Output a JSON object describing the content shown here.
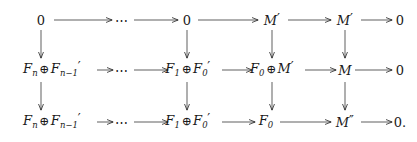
{
  "figure": {
    "kind": "commutative-diagram",
    "ink_color": "#1a1a1a",
    "background_color": "#ffffff"
  },
  "rows": [
    {
      "id": "row-top",
      "y": 20,
      "nodes": [
        {
          "id": "r1c1",
          "x": 41,
          "kind": "zero",
          "base": "0",
          "sub": "",
          "primes": 0,
          "trailing": ""
        },
        {
          "id": "r1c2",
          "x": 123,
          "kind": "ellipsis",
          "base": "⋯",
          "sub": "",
          "primes": 0,
          "trailing": ""
        },
        {
          "id": "r1c3",
          "x": 187,
          "kind": "zero",
          "base": "0",
          "sub": "",
          "primes": 0,
          "trailing": ""
        },
        {
          "id": "r1c4",
          "x": 272,
          "kind": "module",
          "base": "M",
          "sub": "",
          "primes": 1,
          "trailing": ""
        },
        {
          "id": "r1c5",
          "x": 345,
          "kind": "module",
          "base": "M",
          "sub": "",
          "primes": 1,
          "trailing": ""
        },
        {
          "id": "r1c6",
          "x": 400,
          "kind": "zero",
          "base": "0",
          "sub": "",
          "primes": 0,
          "trailing": ""
        }
      ]
    },
    {
      "id": "row-middle",
      "y": 70,
      "nodes": [
        {
          "id": "r2c1",
          "x": 52,
          "kind": "sum",
          "left_base": "F",
          "left_sub": "n",
          "left_primes": 0,
          "op": "⊕",
          "right_base": "F",
          "right_sub": "n−1",
          "right_primes": 1,
          "trailing": ""
        },
        {
          "id": "r2c2",
          "x": 123,
          "kind": "ellipsis",
          "base": "⋯",
          "sub": "",
          "primes": 0,
          "trailing": ""
        },
        {
          "id": "r2c3",
          "x": 188,
          "kind": "sum",
          "left_base": "F",
          "left_sub": "1",
          "left_primes": 0,
          "op": "⊕",
          "right_base": "F",
          "right_sub": "0",
          "right_primes": 1,
          "trailing": ""
        },
        {
          "id": "r2c4",
          "x": 272,
          "kind": "sum",
          "left_base": "F",
          "left_sub": "0",
          "left_primes": 0,
          "op": "⊕",
          "right_base": "M",
          "right_sub": "",
          "right_primes": 1,
          "trailing": ""
        },
        {
          "id": "r2c5",
          "x": 345,
          "kind": "module",
          "base": "M",
          "sub": "",
          "primes": 0,
          "trailing": ""
        },
        {
          "id": "r2c6",
          "x": 400,
          "kind": "zero",
          "base": "0",
          "sub": "",
          "primes": 0,
          "trailing": ""
        }
      ]
    },
    {
      "id": "row-bottom",
      "y": 122,
      "nodes": [
        {
          "id": "r3c1",
          "x": 52,
          "kind": "sum",
          "left_base": "F",
          "left_sub": "n",
          "left_primes": 0,
          "op": "⊕",
          "right_base": "F",
          "right_sub": "n−1",
          "right_primes": 1,
          "trailing": ""
        },
        {
          "id": "r3c2",
          "x": 123,
          "kind": "ellipsis",
          "base": "⋯",
          "sub": "",
          "primes": 0,
          "trailing": ""
        },
        {
          "id": "r3c3",
          "x": 188,
          "kind": "sum",
          "left_base": "F",
          "left_sub": "1",
          "left_primes": 0,
          "op": "⊕",
          "right_base": "F",
          "right_sub": "0",
          "right_primes": 1,
          "trailing": ""
        },
        {
          "id": "r3c4",
          "x": 266,
          "kind": "module",
          "base": "F",
          "sub": "0",
          "primes": 0,
          "trailing": ""
        },
        {
          "id": "r3c5",
          "x": 345,
          "kind": "module",
          "base": "M",
          "sub": "",
          "primes": 2,
          "trailing": ""
        },
        {
          "id": "r3c6",
          "x": 400,
          "kind": "zero",
          "base": "0",
          "sub": "",
          "primes": 0,
          "trailing": "."
        }
      ]
    }
  ],
  "horizontal_arrows": [
    {
      "id": "h-r1-1",
      "row": "row-top",
      "x1": 54,
      "x2": 112,
      "y": 20,
      "label": ""
    },
    {
      "id": "h-r1-2",
      "row": "row-top",
      "x1": 134,
      "x2": 178,
      "y": 20,
      "label": ""
    },
    {
      "id": "h-r1-3",
      "row": "row-top",
      "x1": 198,
      "x2": 258,
      "y": 20,
      "label": ""
    },
    {
      "id": "h-r1-4",
      "row": "row-top",
      "x1": 288,
      "x2": 331,
      "y": 20,
      "label": ""
    },
    {
      "id": "h-r1-5",
      "row": "row-top",
      "x1": 361,
      "x2": 392,
      "y": 20,
      "label": ""
    },
    {
      "id": "h-r2-1",
      "row": "row-middle",
      "x1": 97,
      "x2": 113,
      "y": 70,
      "label": ""
    },
    {
      "id": "h-r2-2",
      "row": "row-middle",
      "x1": 134,
      "x2": 168,
      "y": 70,
      "label": ""
    },
    {
      "id": "h-r2-3",
      "row": "row-middle",
      "x1": 222,
      "x2": 252,
      "y": 70,
      "label": ""
    },
    {
      "id": "h-r2-4",
      "row": "row-middle",
      "x1": 305,
      "x2": 336,
      "y": 70,
      "label": ""
    },
    {
      "id": "h-r2-5",
      "row": "row-middle",
      "x1": 355,
      "x2": 392,
      "y": 70,
      "label": ""
    },
    {
      "id": "h-r3-1",
      "row": "row-bottom",
      "x1": 97,
      "x2": 113,
      "y": 122,
      "label": ""
    },
    {
      "id": "h-r3-2",
      "row": "row-bottom",
      "x1": 134,
      "x2": 168,
      "y": 122,
      "label": ""
    },
    {
      "id": "h-r3-3",
      "row": "row-bottom",
      "x1": 222,
      "x2": 255,
      "y": 122,
      "label": ""
    },
    {
      "id": "h-r3-4",
      "row": "row-bottom",
      "x1": 280,
      "x2": 331,
      "y": 122,
      "label": ""
    },
    {
      "id": "h-r3-5",
      "row": "row-bottom",
      "x1": 361,
      "x2": 392,
      "y": 122,
      "label": ""
    }
  ],
  "vertical_arrows": [
    {
      "id": "v-c1-a",
      "x": 41,
      "y1": 30,
      "y2": 58,
      "label": ""
    },
    {
      "id": "v-c3-a",
      "x": 187,
      "y1": 30,
      "y2": 58,
      "label": ""
    },
    {
      "id": "v-c4-a",
      "x": 272,
      "y1": 30,
      "y2": 58,
      "label": ""
    },
    {
      "id": "v-c5-a",
      "x": 345,
      "y1": 30,
      "y2": 58,
      "label": ""
    },
    {
      "id": "v-c1-b",
      "x": 41,
      "y1": 82,
      "y2": 110,
      "label": ""
    },
    {
      "id": "v-c3-b",
      "x": 187,
      "y1": 82,
      "y2": 110,
      "label": ""
    },
    {
      "id": "v-c4-b",
      "x": 272,
      "y1": 82,
      "y2": 110,
      "label": ""
    },
    {
      "id": "v-c5-b",
      "x": 345,
      "y1": 82,
      "y2": 110,
      "label": ""
    }
  ]
}
